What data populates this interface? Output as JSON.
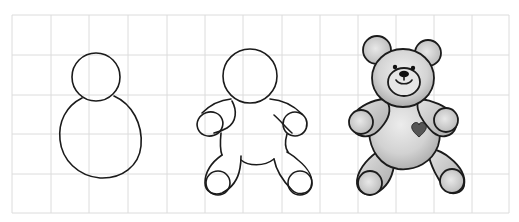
{
  "illustration": {
    "title": "How to draw a teddy bear",
    "steps": [
      {
        "label": "Step 1",
        "description": "Head circle and body oval"
      },
      {
        "label": "Step 2",
        "description": "Outline with arms and legs"
      },
      {
        "label": "Step 3",
        "description": "Finished shaded teddy bear with ears, face and heart"
      }
    ]
  },
  "colors": {
    "background": "#ffffff",
    "grid": "#dcdcdc",
    "ink": "#1b1b1b",
    "shade": "#c9c9c9",
    "shade_light": "#e2e2e2",
    "heart": "#555555"
  },
  "grid": {
    "x_lines": [
      12,
      51,
      89,
      128,
      167,
      205,
      243,
      282,
      320,
      358,
      396,
      434,
      472,
      509
    ],
    "y_lines": [
      15,
      55,
      95,
      134,
      174,
      213
    ]
  }
}
